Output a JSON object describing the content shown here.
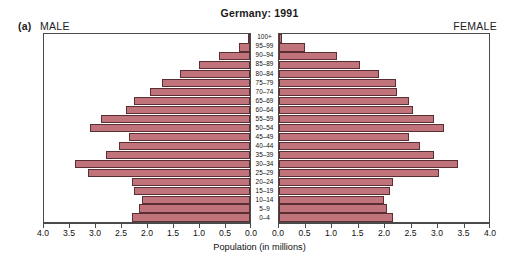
{
  "figure": {
    "panel_letter": "(a)",
    "title": "Germany: 1991",
    "left_label": "MALE",
    "right_label": "FEMALE",
    "axis_title": "Population (in millions)",
    "bar_color": "#c0737a",
    "bar_border_color": "#5a2f33",
    "frame_color": "#4a4a4a"
  },
  "chart_data": {
    "type": "bar",
    "subtype": "population-pyramid",
    "title": "Germany: 1991",
    "xlabel": "Population (in millions)",
    "ylabel": "",
    "grid": false,
    "legend": "none",
    "xlim_left": [
      4.0,
      0.0
    ],
    "xlim_right": [
      0.0,
      4.0
    ],
    "xticks_left": [
      "4.0",
      "3.5",
      "3.0",
      "2.5",
      "2.0",
      "1.5",
      "1.0",
      "0.5",
      "0.0"
    ],
    "xticks_right": [
      "0.0",
      "0.5",
      "1.0",
      "1.5",
      "2.0",
      "2.5",
      "3.0",
      "3.5",
      "4.0"
    ],
    "xtick_values": [
      0.0,
      0.5,
      1.0,
      1.5,
      2.0,
      2.5,
      3.0,
      3.5,
      4.0
    ],
    "categories": [
      "0-4",
      "5-9",
      "10-14",
      "15-19",
      "20-24",
      "25-29",
      "30-34",
      "35-39",
      "40-44",
      "45-49",
      "50-54",
      "55-59",
      "60-64",
      "65-69",
      "70-74",
      "75-79",
      "80-84",
      "85-89",
      "90-94",
      "95-99",
      "100+"
    ],
    "series": [
      {
        "name": "MALE",
        "side": "left",
        "values": [
          2.3,
          2.15,
          2.1,
          2.25,
          2.3,
          3.15,
          3.4,
          2.8,
          2.55,
          2.35,
          3.1,
          2.9,
          2.4,
          2.25,
          1.95,
          1.7,
          1.35,
          1.0,
          0.6,
          0.22,
          0.03
        ]
      },
      {
        "name": "FEMALE",
        "side": "right",
        "values": [
          2.18,
          2.05,
          2.0,
          2.12,
          2.18,
          3.05,
          3.4,
          2.95,
          2.68,
          2.48,
          3.15,
          2.95,
          2.55,
          2.48,
          2.25,
          2.22,
          1.9,
          1.55,
          1.1,
          0.5,
          0.05
        ]
      }
    ]
  }
}
